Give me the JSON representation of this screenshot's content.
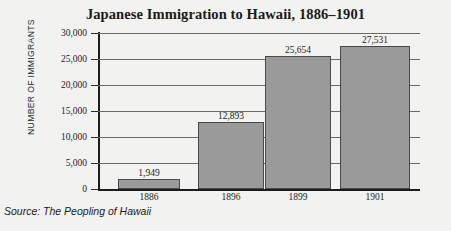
{
  "chart_data": {
    "type": "bar",
    "title": "Japanese Immigration to Hawaii, 1886–1901",
    "xlabel": "",
    "ylabel": "NUMBER OF IMMIGRANTS",
    "categories": [
      "1886",
      "1896",
      "1899",
      "1901"
    ],
    "values": [
      1949,
      12893,
      25654,
      27531
    ],
    "value_labels": [
      "1,949",
      "12,893",
      "25,654",
      "27,531"
    ],
    "ylim": [
      0,
      30000
    ],
    "ytick_values": [
      0,
      5000,
      10000,
      15000,
      20000,
      25000,
      30000
    ],
    "ytick_labels": [
      "0",
      "5,000",
      "10,000",
      "15,000",
      "20,000",
      "25,000",
      "30,000"
    ],
    "grid": true,
    "legend": false,
    "bar_color": "#9a9a9a",
    "bar_edge_color": "#4a4a4a",
    "background_color": "#f2f2f1",
    "axis_color": "#1c1c1c"
  },
  "source": {
    "note": "Source: The Peopling of Hawaii"
  }
}
